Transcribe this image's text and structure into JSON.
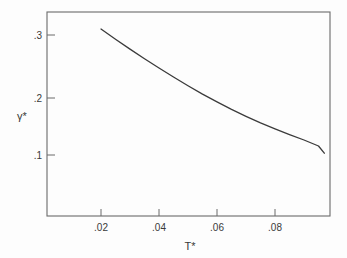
{
  "chart_data": {
    "type": "line",
    "title": "",
    "subtitle": "",
    "xlabel": "T*",
    "ylabel": "γ*",
    "xlim": [
      0.0105,
      0.1005
    ],
    "ylim": [
      0.0,
      0.345
    ],
    "grid": false,
    "legend": null,
    "xticks": [
      0.02,
      0.04,
      0.06,
      0.08
    ],
    "xtick_labels": [
      ".02",
      ".04",
      ".06",
      ".08"
    ],
    "yticks": [
      0.1,
      0.2,
      0.3
    ],
    "ytick_labels": [
      ".1",
      ".2",
      ".3"
    ],
    "series": [
      {
        "name": "gamma-star",
        "x": [
          0.02,
          0.025,
          0.03,
          0.035,
          0.04,
          0.045,
          0.05,
          0.055,
          0.06,
          0.065,
          0.07,
          0.075,
          0.08,
          0.085,
          0.09,
          0.095,
          0.097
        ],
        "values": [
          0.31,
          0.293,
          0.2765,
          0.2605,
          0.245,
          0.23,
          0.2155,
          0.2015,
          0.1885,
          0.176,
          0.1645,
          0.1535,
          0.1435,
          0.134,
          0.125,
          0.115,
          0.103
        ]
      }
    ],
    "annotations": []
  },
  "axis": {
    "x_title": "T*",
    "y_title": "γ*"
  },
  "colors": {
    "background": "#fdfdfd",
    "frame": "#6b6b6b",
    "curve": "#3b3b3b",
    "text": "#3a3a3a"
  }
}
